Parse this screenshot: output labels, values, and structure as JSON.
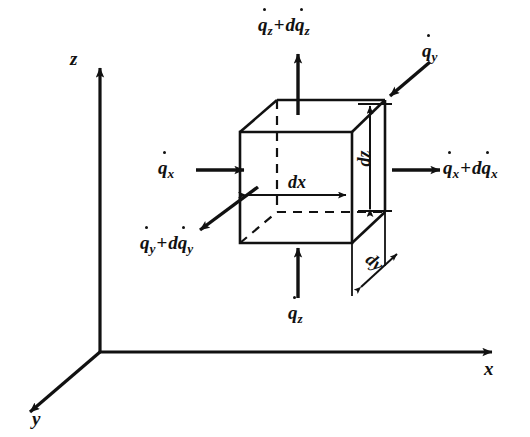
{
  "figure": {
    "background_color": "#ffffff",
    "line_color": "#111111"
  },
  "axes": [
    {
      "name": "z",
      "label": "z",
      "direction": "up"
    },
    {
      "name": "x",
      "label": "x",
      "direction": "right"
    },
    {
      "name": "y",
      "label": "y",
      "direction": "down-left"
    }
  ],
  "flux_labels": {
    "top": {
      "base": "q",
      "sub": "z",
      "operator": "+",
      "delta_prefix": "d",
      "delta_base": "q",
      "delta_sub": "z",
      "full": "q̇z + dq̇z",
      "arrow": "up"
    },
    "bottom": {
      "base": "q",
      "sub": "z",
      "full": "q̇z",
      "arrow": "up"
    },
    "left": {
      "base": "q",
      "sub": "x",
      "full": "q̇x",
      "arrow": "right"
    },
    "right": {
      "base": "q",
      "sub": "x",
      "operator": "+",
      "delta_prefix": "d",
      "delta_base": "q",
      "delta_sub": "x",
      "full": "q̇x + dq̇x",
      "arrow": "right"
    },
    "upper_right": {
      "base": "q",
      "sub": "y",
      "full": "q̇y",
      "arrow": "down-left"
    },
    "lower_left": {
      "base": "q",
      "sub": "y",
      "operator": "+",
      "delta_prefix": "d",
      "delta_base": "q",
      "delta_sub": "y",
      "full": "q̇y + dq̇y",
      "arrow": "down-left"
    }
  },
  "dimensions": [
    {
      "name": "dx",
      "prefix": "d",
      "axis": "x",
      "label": "dx",
      "orientation": "horizontal"
    },
    {
      "name": "dz",
      "prefix": "d",
      "axis": "z",
      "label": "dz",
      "orientation": "vertical"
    },
    {
      "name": "dy",
      "prefix": "d",
      "axis": "y",
      "label": "dy",
      "orientation": "diagonal"
    }
  ]
}
